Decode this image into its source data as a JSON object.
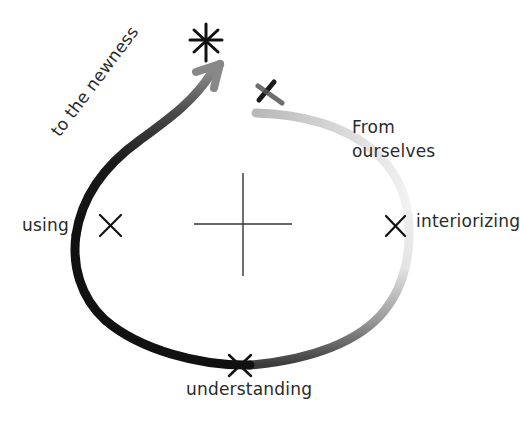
{
  "diagram": {
    "title": "",
    "labels": {
      "using": "using",
      "interiorizing": "interiorizing",
      "understanding": "understanding",
      "from_line1": "From",
      "from_line2": "ourselves",
      "to_the_newness": "to the newness"
    },
    "markers": [
      {
        "name": "start-x",
        "glyph": "x",
        "x": 267,
        "y": 92
      },
      {
        "name": "interiorizing-x",
        "glyph": "x",
        "x": 395,
        "y": 225
      },
      {
        "name": "understanding-x",
        "glyph": "x",
        "x": 239,
        "y": 365
      },
      {
        "name": "using-x",
        "glyph": "x",
        "x": 110,
        "y": 224
      },
      {
        "name": "goal-asterisk",
        "glyph": "*",
        "x": 206,
        "y": 44
      }
    ],
    "center_cross": {
      "x": 243,
      "y": 224,
      "half_width": 49,
      "half_height": 51
    },
    "path": {
      "gradient_start": "#f2f2f2",
      "gradient_end": "#111111",
      "arrow_color": "#7a7a7a"
    }
  }
}
